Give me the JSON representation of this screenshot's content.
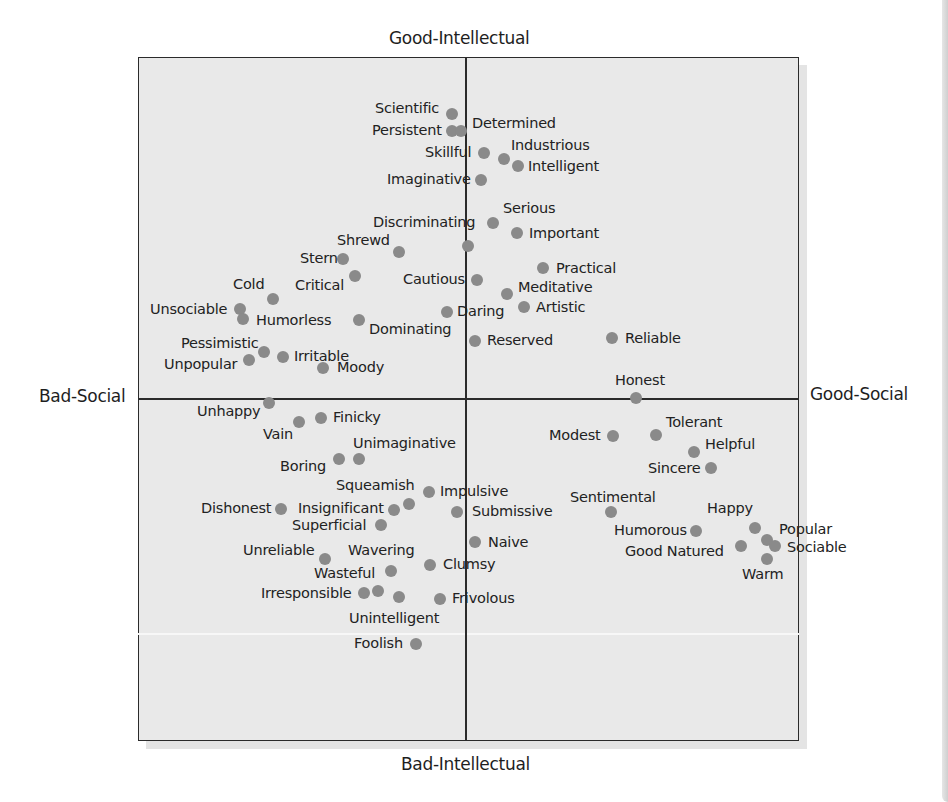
{
  "colors": {
    "dot": "#8a8a8a",
    "frame": "#2b2b2b",
    "plot_background": "#e9e9e9",
    "text": "#1e1e1e"
  },
  "chart_data": {
    "type": "scatter",
    "title": "",
    "axes": {
      "top": "Good-Intellectual",
      "bottom": "Bad-Intellectual",
      "left": "Bad-Social",
      "right": "Good-Social"
    },
    "xlabel": "Bad-Social ← → Good-Social",
    "ylabel": "Bad-Intellectual ← → Good-Intellectual",
    "grid": false,
    "legend": null,
    "origin_px": {
      "x": 465,
      "y": 398
    },
    "points": [
      {
        "label": "Scientific",
        "x": 452,
        "y": 114,
        "lx": 375,
        "ly": 101
      },
      {
        "label": "Persistent",
        "x": 452,
        "y": 131,
        "lx": 372,
        "ly": 123
      },
      {
        "label": "Determined",
        "x": 461,
        "y": 131,
        "lx": 472,
        "ly": 116
      },
      {
        "label": "Skillful",
        "x": 484,
        "y": 153,
        "lx": 425,
        "ly": 145
      },
      {
        "label": "Industrious",
        "x": 504,
        "y": 159,
        "lx": 511,
        "ly": 138
      },
      {
        "label": "Intelligent",
        "x": 518,
        "y": 166,
        "lx": 528,
        "ly": 159
      },
      {
        "label": "Imaginative",
        "x": 481,
        "y": 180,
        "lx": 387,
        "ly": 172
      },
      {
        "label": "Serious",
        "x": 493,
        "y": 223,
        "lx": 503,
        "ly": 201
      },
      {
        "label": "Discriminating",
        "x": 493,
        "y": 223,
        "lx": 373,
        "ly": 215
      },
      {
        "label": "Important",
        "x": 517,
        "y": 233,
        "lx": 529,
        "ly": 226
      },
      {
        "label": "Shrewd",
        "x": 399,
        "y": 252,
        "lx": 337,
        "ly": 233
      },
      {
        "label": "",
        "x": 468,
        "y": 246,
        "lx": 0,
        "ly": 0
      },
      {
        "label": "Stern",
        "x": 343,
        "y": 259,
        "lx": 300,
        "ly": 251
      },
      {
        "label": "Practical",
        "x": 543,
        "y": 268,
        "lx": 556,
        "ly": 261
      },
      {
        "label": "Critical",
        "x": 355,
        "y": 276,
        "lx": 295,
        "ly": 278
      },
      {
        "label": "Cautious",
        "x": 477,
        "y": 280,
        "lx": 403,
        "ly": 272
      },
      {
        "label": "Cold",
        "x": 273,
        "y": 299,
        "lx": 233,
        "ly": 277
      },
      {
        "label": "Meditative",
        "x": 507,
        "y": 294,
        "lx": 518,
        "ly": 280
      },
      {
        "label": "Unsociable",
        "x": 240,
        "y": 309,
        "lx": 150,
        "ly": 302
      },
      {
        "label": "Humorless",
        "x": 243,
        "y": 319,
        "lx": 256,
        "ly": 313
      },
      {
        "label": "Daring",
        "x": 447,
        "y": 312,
        "lx": 457,
        "ly": 304
      },
      {
        "label": "Artistic",
        "x": 524,
        "y": 307,
        "lx": 536,
        "ly": 300
      },
      {
        "label": "Dominating",
        "x": 359,
        "y": 320,
        "lx": 369,
        "ly": 322
      },
      {
        "label": "Reliable",
        "x": 612,
        "y": 338,
        "lx": 625,
        "ly": 331
      },
      {
        "label": "Reserved",
        "x": 475,
        "y": 341,
        "lx": 487,
        "ly": 333
      },
      {
        "label": "Pessimistic",
        "x": 264,
        "y": 352,
        "lx": 181,
        "ly": 336
      },
      {
        "label": "Irritable",
        "x": 283,
        "y": 357,
        "lx": 294,
        "ly": 349
      },
      {
        "label": "Unpopular",
        "x": 249,
        "y": 360,
        "lx": 164,
        "ly": 357
      },
      {
        "label": "Moody",
        "x": 323,
        "y": 368,
        "lx": 337,
        "ly": 360
      },
      {
        "label": "Honest",
        "x": 636,
        "y": 398,
        "lx": 615,
        "ly": 373
      },
      {
        "label": "Unhappy",
        "x": 269,
        "y": 403,
        "lx": 197,
        "ly": 404
      },
      {
        "label": "Vain",
        "x": 299,
        "y": 422,
        "lx": 263,
        "ly": 427
      },
      {
        "label": "Finicky",
        "x": 321,
        "y": 418,
        "lx": 333,
        "ly": 410
      },
      {
        "label": "Tolerant",
        "x": 656,
        "y": 435,
        "lx": 666,
        "ly": 415
      },
      {
        "label": "Modest",
        "x": 613,
        "y": 436,
        "lx": 549,
        "ly": 428
      },
      {
        "label": "Unimaginative",
        "x": 359,
        "y": 459,
        "lx": 353,
        "ly": 436
      },
      {
        "label": "Helpful",
        "x": 694,
        "y": 452,
        "lx": 705,
        "ly": 437
      },
      {
        "label": "Boring",
        "x": 339,
        "y": 459,
        "lx": 280,
        "ly": 459
      },
      {
        "label": "Sincere",
        "x": 711,
        "y": 468,
        "lx": 648,
        "ly": 461
      },
      {
        "label": "Squeamish",
        "x": 429,
        "y": 492,
        "lx": 336,
        "ly": 478
      },
      {
        "label": "Impulsive",
        "x": 429,
        "y": 492,
        "lx": 440,
        "ly": 484
      },
      {
        "label": "Sentimental",
        "x": 611,
        "y": 512,
        "lx": 570,
        "ly": 490
      },
      {
        "label": "Happy",
        "x": 755,
        "y": 528,
        "lx": 707,
        "ly": 501
      },
      {
        "label": "Insignificant",
        "x": 409,
        "y": 504,
        "lx": 298,
        "ly": 501
      },
      {
        "label": "",
        "x": 394,
        "y": 510,
        "lx": 0,
        "ly": 0
      },
      {
        "label": "Dishonest",
        "x": 281,
        "y": 509,
        "lx": 201,
        "ly": 501
      },
      {
        "label": "Submissive",
        "x": 457,
        "y": 512,
        "lx": 472,
        "ly": 504
      },
      {
        "label": "Superficial",
        "x": 381,
        "y": 525,
        "lx": 292,
        "ly": 518
      },
      {
        "label": "Humorous",
        "x": 696,
        "y": 531,
        "lx": 614,
        "ly": 523
      },
      {
        "label": "Popular",
        "x": 767,
        "y": 540,
        "lx": 779,
        "ly": 522
      },
      {
        "label": "Sociable",
        "x": 775,
        "y": 546,
        "lx": 787,
        "ly": 540
      },
      {
        "label": "Good Natured",
        "x": 741,
        "y": 546,
        "lx": 625,
        "ly": 544
      },
      {
        "label": "Naive",
        "x": 475,
        "y": 542,
        "lx": 488,
        "ly": 535
      },
      {
        "label": "Warm",
        "x": 767,
        "y": 559,
        "lx": 742,
        "ly": 567
      },
      {
        "label": "Unreliable",
        "x": 325,
        "y": 559,
        "lx": 243,
        "ly": 543
      },
      {
        "label": "Wavering",
        "x": 430,
        "y": 565,
        "lx": 348,
        "ly": 543
      },
      {
        "label": "Clumsy",
        "x": 430,
        "y": 565,
        "lx": 443,
        "ly": 557
      },
      {
        "label": "Wasteful",
        "x": 391,
        "y": 571,
        "lx": 314,
        "ly": 566
      },
      {
        "label": "Irresponsible",
        "x": 364,
        "y": 593,
        "lx": 261,
        "ly": 586
      },
      {
        "label": "",
        "x": 378,
        "y": 591,
        "lx": 0,
        "ly": 0
      },
      {
        "label": "",
        "x": 399,
        "y": 597,
        "lx": 0,
        "ly": 0
      },
      {
        "label": "Frivolous",
        "x": 440,
        "y": 599,
        "lx": 452,
        "ly": 591
      },
      {
        "label": "Unintelligent",
        "x": 440,
        "y": 599,
        "lx": 349,
        "ly": 611
      },
      {
        "label": "Foolish",
        "x": 416,
        "y": 644,
        "lx": 354,
        "ly": 636
      }
    ]
  }
}
